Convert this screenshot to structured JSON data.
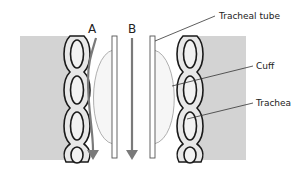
{
  "diagram": {
    "labels": {
      "flow_a": "A",
      "flow_b": "B",
      "tracheal_tube": "Tracheal tube",
      "cuff": "Cuff",
      "trachea": "Trachea"
    },
    "colors": {
      "tissue": "#d3d3d3",
      "ring_stroke": "#1a1a1a",
      "ring_fill": "#f2f2f2",
      "arrow": "#7a7a7a",
      "cuff_fill": "#f6f6f6",
      "cuff_stroke": "#9a9a9a",
      "tube": "#555555",
      "leader": "#333333"
    }
  }
}
